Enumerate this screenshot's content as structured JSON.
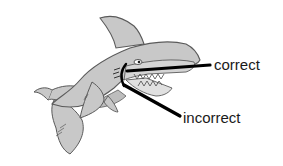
{
  "diagram": {
    "labels": {
      "correct": "correct",
      "incorrect": "incorrect"
    },
    "colors": {
      "shark_fill": "#c8c8c8",
      "shark_outline": "#5a5a5a",
      "pointer_lines": "#000000",
      "text": "#1a1a1a",
      "background": "#ffffff"
    }
  }
}
